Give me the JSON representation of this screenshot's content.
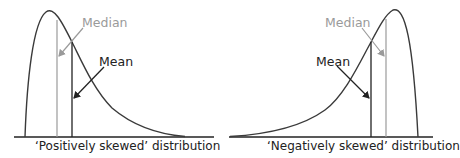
{
  "colors": {
    "curve": "#3a3a3a",
    "mean": "#222222",
    "median": "#9a9a9a",
    "baseline": "#222222"
  },
  "diagrams": [
    {
      "id": "positive",
      "caption": "‘Positively skewed’ distribution",
      "median_label": "Median",
      "mean_label": "Mean",
      "skew": "positive",
      "order_left_to_right": [
        "mode (peak)",
        "median",
        "mean"
      ]
    },
    {
      "id": "negative",
      "caption": "‘Negatively skewed’ distribution",
      "median_label": "Median",
      "mean_label": "Mean",
      "skew": "negative",
      "order_left_to_right": [
        "mean",
        "median",
        "mode (peak)"
      ]
    }
  ]
}
